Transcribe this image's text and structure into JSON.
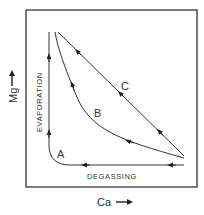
{
  "diagram": {
    "y_axis_label": "Mg",
    "x_axis_label": "Ca",
    "process_labels": {
      "evaporation": "EVAPORATION",
      "degassing": "DEGASSING"
    },
    "curves": [
      {
        "id": "A",
        "label": "A"
      },
      {
        "id": "B",
        "label": "B"
      },
      {
        "id": "C",
        "label": "C"
      }
    ],
    "colors": {
      "line": "#333333",
      "background": "#ffffff"
    }
  }
}
